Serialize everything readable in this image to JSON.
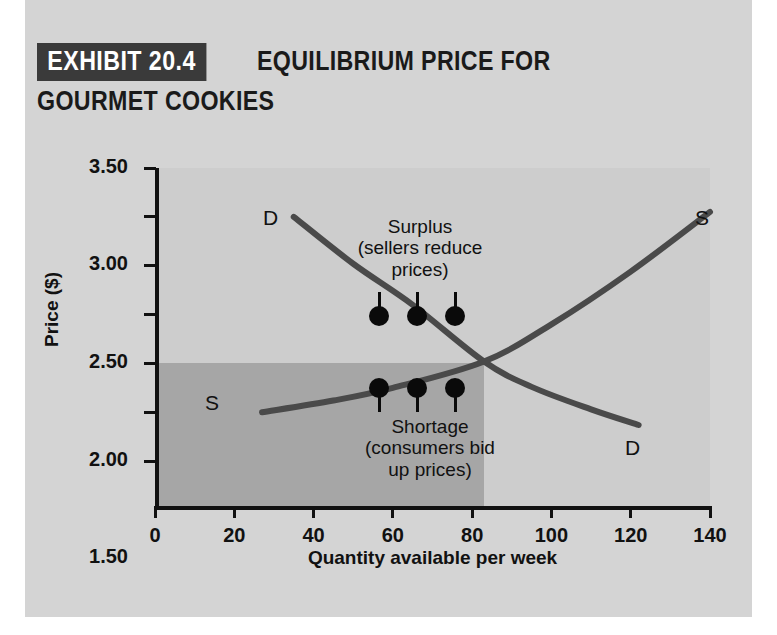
{
  "header": {
    "exhibit_badge": "EXHIBIT 20.4",
    "title_line_1": "EQUILIBRIUM PRICE FOR",
    "title_line_2": "GOURMET COOKIES"
  },
  "colors": {
    "panel_background": "#d4d4d4",
    "plot_background": "#cdcdcd",
    "shortage_region": "#a6a6a6",
    "curve": "#4a4a4a",
    "axis": "#111111",
    "badge_background": "#3a3a3a",
    "marker": "#0a0a0a"
  },
  "chart_data": {
    "type": "line",
    "title": "EQUILIBRIUM PRICE FOR GOURMET COOKIES",
    "xlabel": "Quantity available per week",
    "ylabel": "Price ($)",
    "xlim": [
      0,
      140
    ],
    "ylim": [
      0,
      3.5
    ],
    "grid": false,
    "legend": "inline-curve-labels",
    "xticks": [
      0,
      20,
      40,
      60,
      80,
      100,
      120,
      140
    ],
    "xtick_labels": [
      "0",
      "20",
      "40",
      "60",
      "80",
      "100",
      "120",
      "140"
    ],
    "yticks": [
      0.5,
      1.0,
      1.5,
      2.0,
      2.5,
      3.0,
      3.5
    ],
    "ytick_labels": [
      "0.50",
      "1.00",
      "1.50",
      "2.00",
      "2.50",
      "3.00",
      "3.50"
    ],
    "series": [
      {
        "name": "D",
        "label": "Demand",
        "end_labels": [
          "D",
          "D"
        ],
        "points": [
          [
            35,
            3.0
          ],
          [
            50,
            2.52
          ],
          [
            65,
            2.1
          ],
          [
            83,
            1.52
          ],
          [
            95,
            1.26
          ],
          [
            110,
            1.03
          ],
          [
            122,
            0.87
          ]
        ]
      },
      {
        "name": "S",
        "label": "Supply",
        "end_labels": [
          "S",
          "S"
        ],
        "points": [
          [
            27,
            1.0
          ],
          [
            45,
            1.12
          ],
          [
            60,
            1.25
          ],
          [
            83,
            1.52
          ],
          [
            100,
            1.9
          ],
          [
            120,
            2.44
          ],
          [
            140,
            3.05
          ]
        ]
      }
    ],
    "equilibrium": {
      "quantity": 83,
      "price": 1.5
    },
    "annotations": [
      {
        "name": "surplus",
        "lines": [
          "Surplus",
          "(sellers reduce",
          "prices)"
        ],
        "marker_count": 3,
        "marker_direction": "down"
      },
      {
        "name": "shortage",
        "lines": [
          "Shortage",
          "(consumers bid",
          "up prices)"
        ],
        "marker_count": 3,
        "marker_direction": "up"
      }
    ],
    "shaded_region": {
      "name": "shortage-region",
      "x_range": [
        0,
        83
      ],
      "y_range": [
        0,
        1.5
      ]
    }
  }
}
